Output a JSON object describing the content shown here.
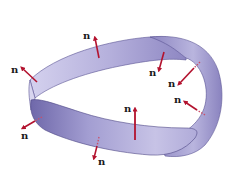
{
  "diagram": {
    "strip_colors": {
      "light": "#c9c6e8",
      "mid": "#a6a1d4",
      "dark": "#7b74b5",
      "edge": "#4d4785"
    },
    "arrow_color": "#b3122e",
    "normal_label": "n",
    "normals": [
      {
        "id": "top-left",
        "label": "n",
        "label_x": 83,
        "label_y": 39
      },
      {
        "id": "left",
        "label": "n",
        "label_x": 11,
        "label_y": 73
      },
      {
        "id": "top-inner",
        "label": "n",
        "label_x": 149,
        "label_y": 76
      },
      {
        "id": "right-upper",
        "label": "n",
        "label_x": 168,
        "label_y": 87
      },
      {
        "id": "right-mid",
        "label": "n",
        "label_x": 174,
        "label_y": 103
      },
      {
        "id": "center",
        "label": "n",
        "label_x": 124,
        "label_y": 112
      },
      {
        "id": "left-lower",
        "label": "n",
        "label_x": 21,
        "label_y": 139
      },
      {
        "id": "bottom",
        "label": "n",
        "label_x": 98,
        "label_y": 165
      }
    ]
  }
}
